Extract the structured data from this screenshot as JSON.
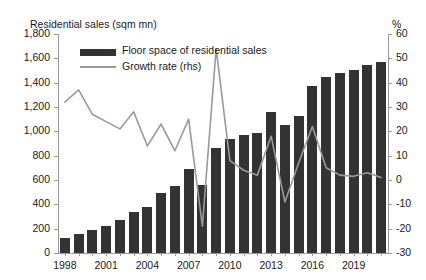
{
  "chart_data": {
    "type": "bar",
    "title": "",
    "ylabel": "Residential sales (sqm mn)",
    "y2label": "%",
    "xlabel": "",
    "ylim": [
      0,
      1800
    ],
    "y2lim": [
      -30,
      60
    ],
    "yticks": [
      "0",
      "200",
      "400",
      "600",
      "800",
      "1,000",
      "1,200",
      "1,400",
      "1,600",
      "1,800"
    ],
    "y2ticks": [
      "-30",
      "-20",
      "-10",
      "0",
      "10",
      "20",
      "30",
      "40",
      "50",
      "60"
    ],
    "grid": false,
    "legend_position": "top-left",
    "x": [
      1998,
      1999,
      2000,
      2001,
      2002,
      2003,
      2004,
      2005,
      2006,
      2007,
      2008,
      2009,
      2010,
      2011,
      2012,
      2013,
      2014,
      2015,
      2016,
      2017,
      2018,
      2019,
      2020,
      2021
    ],
    "xtick_labels": [
      "1998",
      "2001",
      "2004",
      "2007",
      "2010",
      "2013",
      "2016",
      "2019"
    ],
    "xtick_years": [
      1998,
      2001,
      2004,
      2007,
      2010,
      2013,
      2016,
      2019
    ],
    "series": [
      {
        "name": "Floor space of residential sales",
        "type": "bar",
        "axis": "left",
        "color": "#333333",
        "unit": "sqm mn",
        "values": [
          122,
          160,
          186,
          224,
          268,
          338,
          382,
          496,
          554,
          692,
          560,
          861,
          934,
          971,
          985,
          1157,
          1052,
          1124,
          1375,
          1448,
          1479,
          1501,
          1549,
          1566
        ]
      },
      {
        "name": "Growth rate (rhs)",
        "type": "line",
        "axis": "right",
        "color": "#9a9a9a",
        "unit": "%",
        "values": [
          32,
          37,
          27,
          24,
          21,
          28,
          14,
          23,
          12,
          25,
          -19,
          54,
          8,
          4,
          2,
          18,
          -9,
          7,
          22,
          5,
          2,
          1.5,
          3,
          1
        ]
      }
    ]
  }
}
